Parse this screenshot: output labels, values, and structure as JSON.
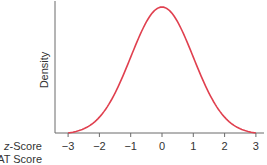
{
  "chart_data": {
    "type": "line",
    "title": "",
    "xlabel": "z-Score / SAT Score",
    "ylabel": "Density",
    "x_axis_rows": [
      {
        "label_italic": "z",
        "label_rest": "-Score",
        "ticks": [
          "−3",
          "−2",
          "−1",
          "0",
          "1",
          "2",
          "3"
        ]
      },
      {
        "label_italic": "",
        "label_rest": "SAT Score",
        "ticks": []
      }
    ],
    "x_ticks": [
      -3,
      -2,
      -1,
      0,
      1,
      2,
      3
    ],
    "xlim": [
      -3.2,
      3.4
    ],
    "series": [
      {
        "name": "Standard normal density",
        "distribution": "normal",
        "mean": 0,
        "sd": 1,
        "x_range": [
          -3,
          3
        ],
        "color": "#e0404f"
      }
    ],
    "grid": false,
    "legend": null
  },
  "colors": {
    "curve": "#e0404f",
    "axis": "#6b6b6b",
    "text": "#333333"
  }
}
